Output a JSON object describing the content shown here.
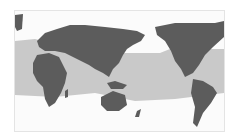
{
  "map": {
    "projection": "Pacific-centered world map",
    "colors": {
      "background": "#fbfbfb",
      "land": "#5c5c5c",
      "highlight_band": "#c9c9c9",
      "frame": "#e4e4e4"
    },
    "legend": null,
    "highlighted_region": "tropical band spanning Atlantic, Indian and Pacific oceans"
  }
}
